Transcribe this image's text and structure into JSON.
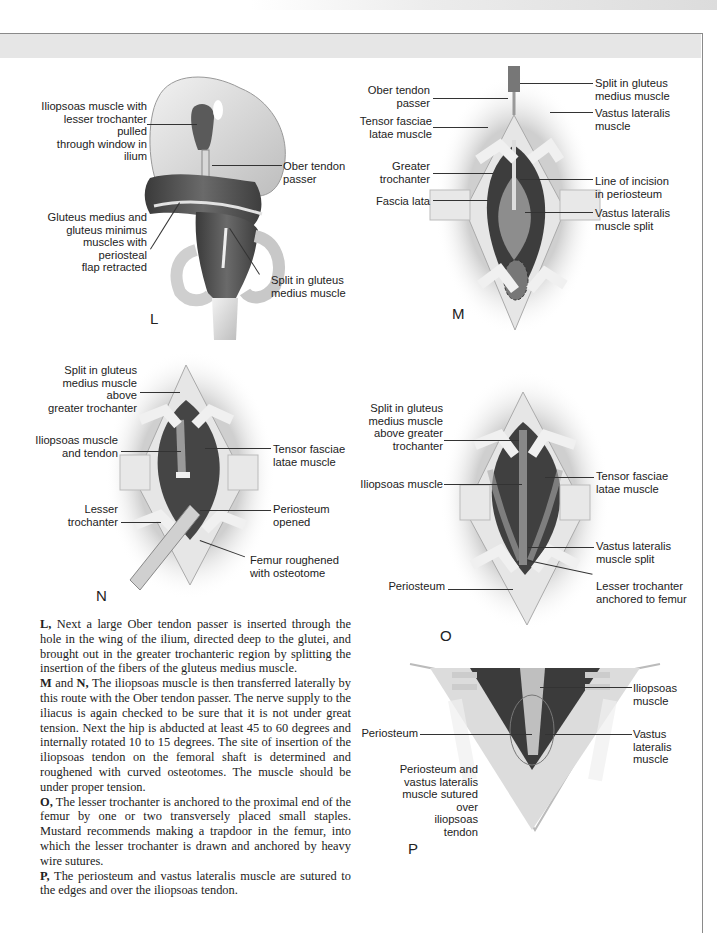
{
  "page": {
    "type": "surgical technique illustration page"
  },
  "figures": {
    "L": {
      "letter": "L",
      "labels": [
        "Iliopsoas muscle with\nlesser trochanter pulled\nthrough window in ilium",
        "Ober tendon\npasser",
        "Gluteus medius and\ngluteus minimus\nmuscles with periosteal\nflap retracted",
        "Split in gluteus\nmedius muscle"
      ]
    },
    "M": {
      "letter": "M",
      "labels": [
        "Ober tendon\npasser",
        "Tensor fasciae\nlatae muscle",
        "Greater\ntrochanter",
        "Fascia lata",
        "Split in gluteus\nmedius muscle",
        "Vastus lateralis\nmuscle",
        "Line of incision\nin periosteum",
        "Vastus lateralis\nmuscle split"
      ]
    },
    "N": {
      "letter": "N",
      "labels": [
        "Split in gluteus\nmedius muscle above\ngreater trochanter",
        "Iliopsoas muscle\nand tendon",
        "Lesser\ntrochanter",
        "Tensor fasciae\nlatae muscle",
        "Periosteum\nopened",
        "Femur roughened\nwith osteotome"
      ]
    },
    "O": {
      "letter": "O",
      "labels": [
        "Split in gluteus\nmedius muscle\nabove greater\ntrochanter",
        "Iliopsoas muscle",
        "Periosteum",
        "Tensor fasciae\nlatae muscle",
        "Vastus lateralis\nmuscle split",
        "Lesser trochanter\nanchored to femur"
      ]
    },
    "P": {
      "letter": "P",
      "labels": [
        "Periosteum",
        "Periosteum and\nvastus lateralis\nmuscle sutured over\niliopsoas\ntendon",
        "Iliopsoas\nmuscle",
        "Vastus\nlateralis\nmuscle"
      ]
    }
  },
  "caption": [
    {
      "key": "L,",
      "text": " Next a large Ober tendon passer is inserted through the hole in the wing of the ilium, directed deep to the glutei, and brought out in the greater trochanteric region by splitting the insertion of the fibers of the gluteus medius muscle."
    },
    {
      "key": "M",
      "mid": " and ",
      "key2": "N,",
      "text": " The iliopsoas muscle is then transferred laterally by this route with the Ober tendon passer. The nerve supply to the iliacus is again checked to be sure that it is not under great tension. Next the hip is abducted at least 45 to 60 degrees and internally rotated 10 to 15 degrees. The site of insertion of the iliopsoas tendon on the femoral shaft is determined and roughened with curved osteotomes. The muscle should be under proper tension."
    },
    {
      "key": "O,",
      "text": " The lesser trochanter is anchored to the proximal end of the femur by one or two transversely placed small staples. Mustard recommends making a trapdoor in the femur, into which the lesser trochanter is drawn and anchored by heavy wire sutures."
    },
    {
      "key": "P,",
      "text": " The periosteum and vastus lateralis muscle are sutured to the edges and over the iliopsoas tendon."
    }
  ],
  "colors": {
    "frame": "#8a8a8a",
    "band": "#e6e6e6",
    "muscle": "#4a4a4a",
    "skin": "#d8d8d8",
    "text": "#222222"
  }
}
